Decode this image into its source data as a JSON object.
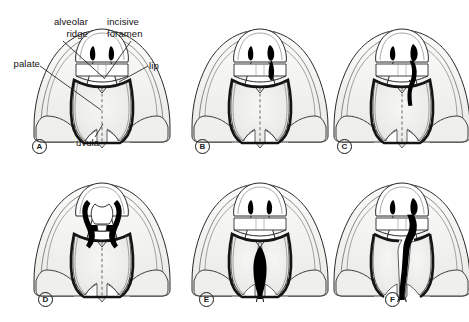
{
  "figure": {
    "view": "inferior view of nose, lip and palate",
    "panel_count": 6,
    "rows": 2,
    "columns": 3
  },
  "annotations": [
    {
      "id": "alveolar-ridge",
      "text": "alveolar\nridge",
      "line1": "alveolar",
      "line2": "ridge",
      "align": "right",
      "x": 30,
      "y": 17
    },
    {
      "id": "incisive-foramen",
      "text": "incisive\nforamen",
      "line1": "incisive",
      "line2": "foramen",
      "align": "left",
      "x": 108,
      "y": 17
    },
    {
      "id": "palate",
      "text": "palate",
      "align": "right",
      "x": 8,
      "y": 60
    },
    {
      "id": "lip",
      "text": "lip",
      "align": "left",
      "x": 150,
      "y": 62
    },
    {
      "id": "uvula",
      "text": "uvula",
      "align": "center",
      "x": 78,
      "y": 140
    }
  ],
  "panels": [
    {
      "letter": "A",
      "condition": "normal lip and palate",
      "cleft_type": "none",
      "letter_x": 32,
      "letter_y": 140
    },
    {
      "letter": "B",
      "condition": "unilateral cleft lip",
      "cleft_type": "lip-only-unilateral",
      "letter_x": 195,
      "letter_y": 140
    },
    {
      "letter": "C",
      "condition": "unilateral cleft lip and alveolus",
      "cleft_type": "lip-and-alveolus-unilateral",
      "letter_x": 337,
      "letter_y": 140
    },
    {
      "letter": "D",
      "condition": "bilateral cleft lip and alveolus",
      "cleft_type": "lip-and-alveolus-bilateral",
      "letter_x": 38,
      "letter_y": 293
    },
    {
      "letter": "E",
      "condition": "isolated cleft palate",
      "cleft_type": "palate-only-midline",
      "letter_x": 199,
      "letter_y": 293
    },
    {
      "letter": "F",
      "condition": "complete unilateral cleft lip and palate",
      "cleft_type": "lip-and-palate-unilateral",
      "letter_x": 385,
      "letter_y": 293
    }
  ],
  "colors": {
    "outline": "#1a1a1a",
    "cleft_fill": "#000000",
    "palate_fill": "#eeeeec",
    "palate_shade": "#e2e2de",
    "cheek_fill": "#f2f2ef",
    "background": "#ffffff",
    "leader_line": "#111111"
  }
}
